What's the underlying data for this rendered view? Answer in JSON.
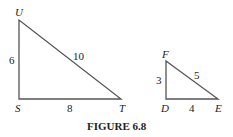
{
  "figure": {
    "caption": "FIGURE 6.8",
    "stroke_color": "#555555"
  },
  "triangle_large": {
    "vertices": {
      "U": {
        "label": "U",
        "x": 19,
        "y": 20
      },
      "S": {
        "label": "S",
        "x": 19,
        "y": 99
      },
      "T": {
        "label": "T",
        "x": 121,
        "y": 99
      }
    },
    "sides": {
      "US": "6",
      "ST": "8",
      "UT": "10"
    },
    "right_angle_at": "S"
  },
  "triangle_small": {
    "vertices": {
      "F": {
        "label": "F",
        "x": 166,
        "y": 61
      },
      "D": {
        "label": "D",
        "x": 166,
        "y": 99
      },
      "E": {
        "label": "E",
        "x": 218,
        "y": 99
      }
    },
    "sides": {
      "FD": "3",
      "DE": "4",
      "FE": "5"
    },
    "right_angle_at": "D"
  }
}
